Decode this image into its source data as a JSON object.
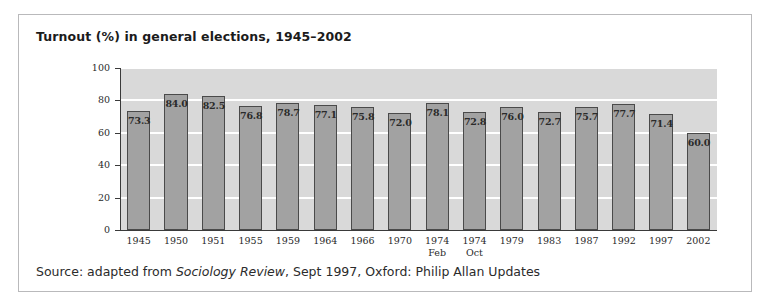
{
  "figure": {
    "title": "Turnout (%) in general elections, 1945–2002",
    "source_prefix": "Source: adapted from ",
    "source_italic": "Sociology Review",
    "source_suffix": ", Sept 1997, Oxford: Philip Allan Updates"
  },
  "colors": {
    "plot_background": "#d9d9d9",
    "bar_fill": "#a2a2a2",
    "bar_outline": "#4a4a4a",
    "gridline": "#ffffff",
    "axis": "#3a3a3a",
    "frame_border": "#b9b9bb",
    "text": "#1b1b1b"
  },
  "chart_data": {
    "type": "bar",
    "title": "Turnout (%) in general elections, 1945–2002",
    "xlabel": "",
    "ylabel": "",
    "ylim": [
      0,
      100
    ],
    "yticks": [
      0,
      20,
      40,
      60,
      80,
      100
    ],
    "grid": true,
    "legend": "none",
    "categories": [
      "1945",
      "1950",
      "1951",
      "1955",
      "1959",
      "1964",
      "1966",
      "1970",
      "1974",
      "1974",
      "1979",
      "1983",
      "1987",
      "1992",
      "1997",
      "2002"
    ],
    "category_sublabels": [
      "",
      "",
      "",
      "",
      "",
      "",
      "",
      "",
      "Feb",
      "Oct",
      "",
      "",
      "",
      "",
      "",
      ""
    ],
    "values": [
      73.3,
      84.0,
      82.5,
      76.8,
      78.7,
      77.1,
      75.8,
      72.0,
      78.1,
      72.8,
      76.0,
      72.7,
      75.7,
      77.7,
      71.4,
      60.0
    ],
    "value_labels": [
      "73.3",
      "84.0",
      "82.5",
      "76.8",
      "78.7",
      "77.1",
      "75.8",
      "72.0",
      "78.1",
      "72.8",
      "76.0",
      "72.7",
      "75.7",
      "77.7",
      "71.4",
      "60.0"
    ]
  }
}
